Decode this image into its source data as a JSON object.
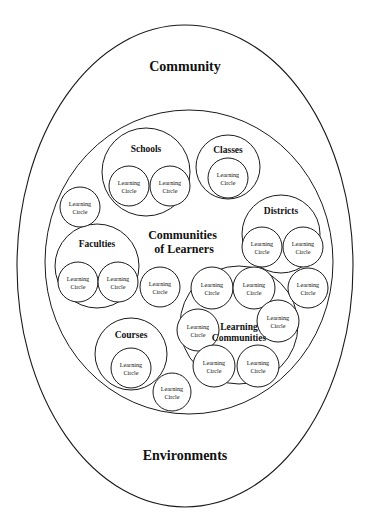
{
  "figure": {
    "type": "nested-set-diagram",
    "background_color": "#ffffff",
    "stroke_color": "#1a1a1a"
  },
  "labels": {
    "community": "Community",
    "environments": "Environments",
    "communities_of_learners_line1": "Communities",
    "communities_of_learners_line2": "of Learners",
    "schools": "Schools",
    "classes": "Classes",
    "districts": "Districts",
    "faculties": "Faculties",
    "courses": "Courses",
    "learning_communities_line1": "Learning",
    "learning_communities_line2": "Communities",
    "learning_circle_line1": "Learning",
    "learning_circle_line2": "Circle"
  },
  "outer_ellipse": {
    "name": "community-ellipse",
    "cx": 185,
    "cy": 266,
    "rx": 168,
    "ry": 241,
    "top_label": "Community",
    "bottom_label": "Environments",
    "top_label_pos": {
      "x": 185,
      "y": 68
    },
    "bottom_label_pos": {
      "x": 185,
      "y": 457
    }
  },
  "inner_ellipse": {
    "name": "communities-of-learners-ellipse",
    "cx": 189,
    "cy": 262,
    "rx": 144,
    "ry": 152,
    "label_pos": {
      "x": 184,
      "y": 236
    }
  },
  "group_circles": [
    {
      "name": "schools-circle",
      "label": "Schools",
      "cx": 146,
      "cy": 172,
      "r": 44,
      "label_dy": -22
    },
    {
      "name": "classes-circle",
      "label": "Classes",
      "cx": 228,
      "cy": 167,
      "r": 32,
      "label_dy": -16
    },
    {
      "name": "districts-circle",
      "label": "Districts",
      "cx": 281,
      "cy": 234,
      "r": 39,
      "label_dy": -22
    },
    {
      "name": "faculties-circle",
      "label": "Faculties",
      "cx": 97,
      "cy": 266,
      "r": 42,
      "label_dy": -21
    },
    {
      "name": "courses-circle",
      "label": "Courses",
      "cx": 131,
      "cy": 354,
      "r": 36,
      "label_dy": -18
    },
    {
      "name": "learning-communities-circle",
      "label": "Learning Communities",
      "cx": 239,
      "cy": 325,
      "r": 59,
      "label_dy": 0
    }
  ],
  "learning_circles": [
    {
      "name": "learning-circle-schools-left",
      "cx": 129,
      "cy": 186,
      "r": 20,
      "parent": "schools-circle"
    },
    {
      "name": "learning-circle-schools-right",
      "cx": 170,
      "cy": 186,
      "r": 20,
      "parent": "schools-circle"
    },
    {
      "name": "learning-circle-classes",
      "cx": 228,
      "cy": 178,
      "r": 20,
      "parent": "classes-circle"
    },
    {
      "name": "learning-circle-districts-left",
      "cx": 262,
      "cy": 247,
      "r": 20,
      "parent": "districts-circle"
    },
    {
      "name": "learning-circle-districts-right",
      "cx": 303,
      "cy": 247,
      "r": 20,
      "parent": "districts-circle"
    },
    {
      "name": "learning-circle-faculties-left",
      "cx": 78,
      "cy": 282,
      "r": 20,
      "parent": "faculties-circle"
    },
    {
      "name": "learning-circle-faculties-right",
      "cx": 118,
      "cy": 282,
      "r": 20,
      "parent": "faculties-circle"
    },
    {
      "name": "learning-circle-courses",
      "cx": 131,
      "cy": 368,
      "r": 20,
      "parent": "courses-circle"
    },
    {
      "name": "learning-circle-lcomm-top-left",
      "cx": 212,
      "cy": 288,
      "r": 21,
      "parent": "learning-communities-circle"
    },
    {
      "name": "learning-circle-lcomm-top-right",
      "cx": 254,
      "cy": 288,
      "r": 21,
      "parent": "learning-communities-circle"
    },
    {
      "name": "learning-circle-lcomm-left",
      "cx": 198,
      "cy": 330,
      "r": 21,
      "parent": "learning-communities-circle"
    },
    {
      "name": "learning-circle-lcomm-right",
      "cx": 278,
      "cy": 321,
      "r": 21,
      "parent": "learning-communities-circle"
    },
    {
      "name": "learning-circle-lcomm-bot-left",
      "cx": 214,
      "cy": 366,
      "r": 21,
      "parent": "learning-communities-circle"
    },
    {
      "name": "learning-circle-lcomm-bot-right",
      "cx": 258,
      "cy": 366,
      "r": 21,
      "parent": "learning-communities-circle"
    },
    {
      "name": "learning-circle-free-upper-left",
      "cx": 80,
      "cy": 207,
      "r": 20,
      "parent": "communities-of-learners-ellipse"
    },
    {
      "name": "learning-circle-free-middle",
      "cx": 160,
      "cy": 287,
      "r": 20,
      "parent": "communities-of-learners-ellipse"
    },
    {
      "name": "learning-circle-free-right",
      "cx": 308,
      "cy": 288,
      "r": 20,
      "parent": "communities-of-learners-ellipse"
    },
    {
      "name": "learning-circle-free-bottom",
      "cx": 172,
      "cy": 392,
      "r": 19,
      "parent": "communities-of-learners-ellipse"
    }
  ]
}
